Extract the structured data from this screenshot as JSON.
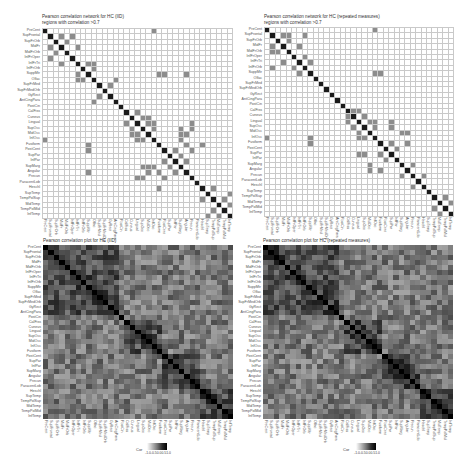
{
  "chart_data": [
    {
      "type": "heatmap",
      "subtype": "thresholded-correlation-network",
      "title": "Pearson correlation network for HC (IID)",
      "subtitle": "regions with correlation >0.7",
      "threshold": 0.7,
      "grid": true,
      "colors": {
        "diagonal": "#1a1a1a",
        "edge": "#8c8c8c",
        "empty": "#ffffff",
        "gridline": "#c9c9c9"
      },
      "edges": [
        [
          0,
          20
        ],
        [
          1,
          3
        ],
        [
          2,
          4
        ],
        [
          1,
          5
        ],
        [
          3,
          6
        ],
        [
          6,
          8
        ],
        [
          7,
          9
        ],
        [
          6,
          9
        ],
        [
          8,
          21
        ],
        [
          8,
          26
        ],
        [
          10,
          12
        ],
        [
          13,
          9
        ],
        [
          15,
          17
        ],
        [
          16,
          18
        ],
        [
          16,
          19
        ],
        [
          17,
          15
        ],
        [
          17,
          19
        ],
        [
          17,
          20
        ],
        [
          18,
          20
        ],
        [
          19,
          17
        ],
        [
          18,
          25
        ],
        [
          19,
          25
        ],
        [
          19,
          26
        ],
        [
          21,
          -1
        ],
        [
          21,
          29
        ],
        [
          22,
          8
        ],
        [
          22,
          24
        ],
        [
          23,
          25
        ],
        [
          24,
          26
        ],
        [
          25,
          20
        ],
        [
          26,
          21
        ],
        [
          27,
          17
        ],
        [
          27,
          18
        ],
        [
          27,
          22
        ],
        [
          29,
          31
        ],
        [
          30,
          34
        ],
        [
          32,
          34
        ],
        [
          33,
          31
        ]
      ]
    },
    {
      "type": "heatmap",
      "subtype": "thresholded-correlation-network",
      "title": "Pearson correlation network for HC (repeated measures)",
      "subtitle": "regions with correlation >0.7",
      "threshold": 0.7,
      "grid": true,
      "colors": {
        "diagonal": "#1a1a1a",
        "edge": "#8c8c8c",
        "empty": "#ffffff",
        "gridline": "#c9c9c9"
      },
      "edges": [
        [
          0,
          20
        ],
        [
          1,
          3
        ],
        [
          2,
          4
        ],
        [
          3,
          1
        ],
        [
          3,
          6
        ],
        [
          4,
          1
        ],
        [
          6,
          8
        ],
        [
          7,
          1
        ],
        [
          7,
          5
        ],
        [
          8,
          21
        ],
        [
          15,
          17
        ],
        [
          15,
          16
        ],
        [
          16,
          18
        ],
        [
          17,
          19
        ],
        [
          17,
          20
        ],
        [
          18,
          20
        ],
        [
          19,
          17
        ],
        [
          19,
          25
        ],
        [
          19,
          26
        ],
        [
          20,
          0
        ],
        [
          20,
          8
        ],
        [
          21,
          23
        ],
        [
          22,
          24
        ],
        [
          23,
          18
        ],
        [
          23,
          17
        ],
        [
          25,
          27
        ],
        [
          26,
          21
        ],
        [
          27,
          29
        ],
        [
          31,
          33
        ],
        [
          32,
          34
        ],
        [
          33,
          31
        ],
        [
          34,
          32
        ]
      ]
    },
    {
      "type": "heatmap",
      "subtype": "correlation-matrix",
      "title": "Pearson correlation plot for HC (IID)",
      "legend": {
        "title": "Cor",
        "ticks": [
          "-1.0",
          "-0.5",
          "0.0",
          "0.5",
          "1.0"
        ],
        "range": [
          -1,
          1
        ],
        "position": "bottom"
      },
      "colormap": "grayscale (white = -1, black = 1)",
      "seed": 7
    },
    {
      "type": "heatmap",
      "subtype": "correlation-matrix",
      "title": "Pearson correlation plot for HC (repeated measures)",
      "legend": {
        "title": "Cor",
        "ticks": [
          "-1.0",
          "-0.5",
          "0.0",
          "0.5",
          "1.0"
        ],
        "range": [
          -1,
          1
        ],
        "position": "bottom"
      },
      "colormap": "grayscale (white = -1, black = 1)",
      "seed": 11
    }
  ],
  "regions": [
    "PreCent",
    "SupFrontal",
    "SupFrOrb",
    "MidFr",
    "MidFrOrb",
    "InfFrOper",
    "InfFrTri",
    "InfFrOrb",
    "SuppMtr",
    "Olfac",
    "SupFrMed",
    "SupFrMedOrb",
    "GyRect",
    "AntCingPara",
    "PostCin",
    "CalFiss",
    "Cuneus",
    "Lingual",
    "SupOcc",
    "MidOcc",
    "InfOcc",
    "Fusiform",
    "PostCent",
    "SupPar",
    "InfPar",
    "SupMarg",
    "Angular",
    "Precun",
    "ParacentLob",
    "Heschl",
    "SupTemp",
    "TempPolSup",
    "MidTemp",
    "TempPolMid",
    "InfTemp"
  ],
  "panels": {
    "tl": {
      "title": "Pearson correlation network for HC (IID)",
      "subtitle": "regions with correlation >0.7"
    },
    "tr": {
      "title": "Pearson correlation network for HC (repeated measures)",
      "subtitle": "regions with correlation >0.7"
    },
    "bl": {
      "title": "Pearson correlation plot for HC (IID)",
      "legend_title": "Cor",
      "legend_ticks": [
        "-1.0",
        "-0.5",
        "0.0",
        "0.5",
        "1.0"
      ]
    },
    "br": {
      "title": "Pearson correlation plot for HC (repeated measures)",
      "legend_title": "Cor",
      "legend_ticks": [
        "-1.0",
        "-0.5",
        "0.0",
        "0.5",
        "1.0"
      ]
    }
  }
}
